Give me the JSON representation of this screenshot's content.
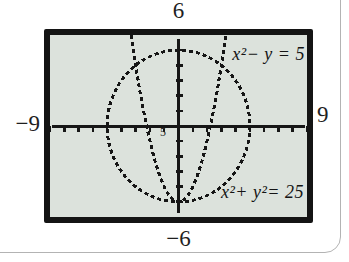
{
  "colors": {
    "screen_bg": "#dce2dc",
    "screen_border": "#141414",
    "ink": "#161616",
    "page_line": "#b3b3b3"
  },
  "window_labels": {
    "top": "6",
    "bottom": "−6",
    "left": "−9",
    "right": "9"
  },
  "equation_labels": {
    "parabola": "x²− y = 5",
    "circle": "x²+ y²= 25"
  },
  "origin_label": "5",
  "chart_data": {
    "type": "line",
    "title": "",
    "xlabel": "",
    "ylabel": "",
    "xlim": [
      -9,
      9
    ],
    "ylim": [
      -6,
      6
    ],
    "xtick_step": 1,
    "ytick_step": 1,
    "grid": false,
    "legend_position": "none",
    "series": [
      {
        "name": "x²−y=5",
        "kind": "parabola",
        "formula": "y = x² − 5",
        "vertex": [
          0,
          -5
        ],
        "sample_points": [
          [
            -3.32,
            6
          ],
          [
            -3,
            4
          ],
          [
            -2,
            -1
          ],
          [
            -1,
            -4
          ],
          [
            0,
            -5
          ],
          [
            1,
            -4
          ],
          [
            2,
            -1
          ],
          [
            3,
            4
          ],
          [
            3.32,
            6
          ]
        ]
      },
      {
        "name": "x²+y²=25",
        "kind": "circle",
        "center": [
          0,
          0
        ],
        "radius": 5
      }
    ],
    "annotations": [
      {
        "text": "x²−y=5",
        "x": 6.5,
        "y": 4.5
      },
      {
        "text": "x²+y²=25",
        "x": 6.2,
        "y": -4.3
      }
    ]
  }
}
